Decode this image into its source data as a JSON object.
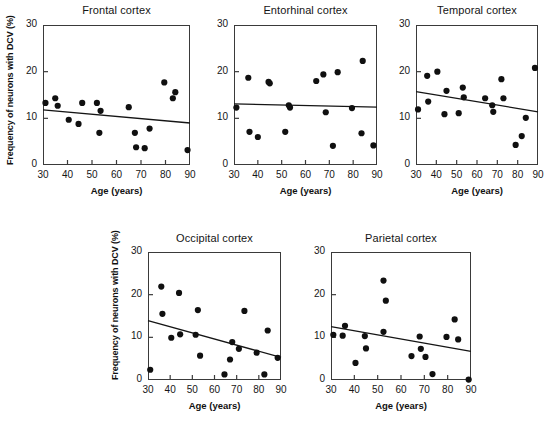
{
  "figure": {
    "xlabel": "Age (years)",
    "ylabel": "Frequency of neurons with DCV (%)",
    "xticks": [
      "30",
      "40",
      "50",
      "60",
      "70",
      "80",
      "90"
    ],
    "yticks": [
      "0",
      "10",
      "20",
      "30"
    ],
    "colors": {
      "point": "#101010",
      "line": "#151515",
      "axis": "#3a3a3a",
      "text": "#151515",
      "background": "#ffffff"
    }
  },
  "chart_data": [
    {
      "type": "scatter",
      "title": "Frontal cortex",
      "xlabel": "Age (years)",
      "ylabel": "Frequency of neurons with DCV (%)",
      "xlim": [
        30,
        90
      ],
      "ylim": [
        0,
        30
      ],
      "xticks": [
        30,
        40,
        50,
        60,
        70,
        80,
        90
      ],
      "yticks": [
        0,
        10,
        20,
        30
      ],
      "grid": false,
      "legend": "none",
      "points": [
        {
          "x": 31,
          "y": 13.3
        },
        {
          "x": 35,
          "y": 14.3
        },
        {
          "x": 36,
          "y": 12.7
        },
        {
          "x": 40.5,
          "y": 9.7
        },
        {
          "x": 44.5,
          "y": 8.8
        },
        {
          "x": 46,
          "y": 13.3
        },
        {
          "x": 52,
          "y": 13.3
        },
        {
          "x": 53,
          "y": 6.9
        },
        {
          "x": 53.5,
          "y": 11.6
        },
        {
          "x": 65,
          "y": 12.4
        },
        {
          "x": 67.5,
          "y": 6.9
        },
        {
          "x": 68,
          "y": 3.8
        },
        {
          "x": 71.5,
          "y": 3.6
        },
        {
          "x": 73.5,
          "y": 7.8
        },
        {
          "x": 79.5,
          "y": 17.7
        },
        {
          "x": 83,
          "y": 14.3
        },
        {
          "x": 84,
          "y": 15.6
        },
        {
          "x": 89,
          "y": 3.2
        }
      ],
      "trendline": {
        "x0": 30,
        "y0": 11.8,
        "x1": 90,
        "y1": 9.0
      }
    },
    {
      "type": "scatter",
      "title": "Entorhinal cortex",
      "xlabel": "Age (years)",
      "ylabel": "Frequency of neurons with DCV (%)",
      "xlim": [
        30,
        90
      ],
      "ylim": [
        0,
        30
      ],
      "xticks": [
        30,
        40,
        50,
        60,
        70,
        80,
        90
      ],
      "yticks": [
        0,
        10,
        20,
        30
      ],
      "grid": false,
      "legend": "none",
      "points": [
        {
          "x": 31,
          "y": 12.3
        },
        {
          "x": 36,
          "y": 18.7
        },
        {
          "x": 36.5,
          "y": 7.1
        },
        {
          "x": 40,
          "y": 6.0
        },
        {
          "x": 44.5,
          "y": 17.8
        },
        {
          "x": 45,
          "y": 17.5
        },
        {
          "x": 51.5,
          "y": 7.1
        },
        {
          "x": 53,
          "y": 12.8
        },
        {
          "x": 53.5,
          "y": 12.3
        },
        {
          "x": 64.5,
          "y": 18.0
        },
        {
          "x": 67.5,
          "y": 19.4
        },
        {
          "x": 68.5,
          "y": 11.3
        },
        {
          "x": 71.5,
          "y": 4.1
        },
        {
          "x": 73.5,
          "y": 19.9
        },
        {
          "x": 79.5,
          "y": 12.2
        },
        {
          "x": 83.5,
          "y": 6.8
        },
        {
          "x": 84,
          "y": 22.3
        },
        {
          "x": 88.5,
          "y": 4.2
        }
      ],
      "trendline": {
        "x0": 30,
        "y0": 13.1,
        "x1": 90,
        "y1": 12.4
      }
    },
    {
      "type": "scatter",
      "title": "Temporal cortex",
      "xlabel": "Age (years)",
      "ylabel": "Frequency of neurons with DCV (%)",
      "xlim": [
        30,
        90
      ],
      "ylim": [
        0,
        30
      ],
      "xticks": [
        30,
        40,
        50,
        60,
        70,
        80,
        90
      ],
      "yticks": [
        0,
        10,
        20,
        30
      ],
      "grid": false,
      "legend": "none",
      "points": [
        {
          "x": 31,
          "y": 11.9
        },
        {
          "x": 35.5,
          "y": 19.1
        },
        {
          "x": 36,
          "y": 13.6
        },
        {
          "x": 40.5,
          "y": 20.0
        },
        {
          "x": 44,
          "y": 10.9
        },
        {
          "x": 45,
          "y": 15.9
        },
        {
          "x": 51,
          "y": 11.1
        },
        {
          "x": 53,
          "y": 16.6
        },
        {
          "x": 53.5,
          "y": 14.5
        },
        {
          "x": 64,
          "y": 14.3
        },
        {
          "x": 67.5,
          "y": 12.8
        },
        {
          "x": 68,
          "y": 11.4
        },
        {
          "x": 72,
          "y": 18.4
        },
        {
          "x": 73,
          "y": 14.3
        },
        {
          "x": 79,
          "y": 4.3
        },
        {
          "x": 82,
          "y": 6.2
        },
        {
          "x": 84,
          "y": 10.1
        },
        {
          "x": 88.5,
          "y": 20.8
        }
      ],
      "trendline": {
        "x0": 30,
        "y0": 15.7,
        "x1": 90,
        "y1": 11.4
      }
    },
    {
      "type": "scatter",
      "title": "Occipital cortex",
      "xlabel": "Age (years)",
      "ylabel": "Frequency of neurons with DCV (%)",
      "xlim": [
        30,
        90
      ],
      "ylim": [
        0,
        30
      ],
      "xticks": [
        30,
        40,
        50,
        60,
        70,
        80,
        90
      ],
      "yticks": [
        0,
        10,
        20,
        30
      ],
      "grid": false,
      "legend": "none",
      "points": [
        {
          "x": 31,
          "y": 2.4
        },
        {
          "x": 36,
          "y": 21.9
        },
        {
          "x": 36.5,
          "y": 15.5
        },
        {
          "x": 40.5,
          "y": 9.9
        },
        {
          "x": 44,
          "y": 20.4
        },
        {
          "x": 44.5,
          "y": 10.7
        },
        {
          "x": 51.5,
          "y": 10.6
        },
        {
          "x": 52.5,
          "y": 16.4
        },
        {
          "x": 53.5,
          "y": 5.7
        },
        {
          "x": 64.5,
          "y": 1.3
        },
        {
          "x": 67,
          "y": 4.8
        },
        {
          "x": 68,
          "y": 8.9
        },
        {
          "x": 71,
          "y": 7.3
        },
        {
          "x": 73.5,
          "y": 16.2
        },
        {
          "x": 79,
          "y": 6.4
        },
        {
          "x": 82.5,
          "y": 1.3
        },
        {
          "x": 84,
          "y": 11.6
        },
        {
          "x": 88.5,
          "y": 5.2
        }
      ],
      "trendline": {
        "x0": 30,
        "y0": 13.9,
        "x1": 90,
        "y1": 5.3
      }
    },
    {
      "type": "scatter",
      "title": "Parietal cortex",
      "xlabel": "Age (years)",
      "ylabel": "Frequency of neurons with DCV (%)",
      "xlim": [
        30,
        90
      ],
      "ylim": [
        0,
        30
      ],
      "xticks": [
        30,
        40,
        50,
        60,
        70,
        80,
        90
      ],
      "yticks": [
        0,
        10,
        20,
        30
      ],
      "grid": false,
      "legend": "none",
      "points": [
        {
          "x": 31,
          "y": 10.6
        },
        {
          "x": 35,
          "y": 10.4
        },
        {
          "x": 36,
          "y": 12.7
        },
        {
          "x": 40.5,
          "y": 4.0
        },
        {
          "x": 44.5,
          "y": 10.3
        },
        {
          "x": 45,
          "y": 7.4
        },
        {
          "x": 52.5,
          "y": 23.3
        },
        {
          "x": 52.5,
          "y": 11.3
        },
        {
          "x": 53.5,
          "y": 18.6
        },
        {
          "x": 64.5,
          "y": 5.6
        },
        {
          "x": 68,
          "y": 10.2
        },
        {
          "x": 68.5,
          "y": 7.3
        },
        {
          "x": 70.5,
          "y": 5.4
        },
        {
          "x": 73.5,
          "y": 1.4
        },
        {
          "x": 79.5,
          "y": 10.1
        },
        {
          "x": 83,
          "y": 14.2
        },
        {
          "x": 84.5,
          "y": 9.5
        },
        {
          "x": 89,
          "y": 0.1
        }
      ],
      "trendline": {
        "x0": 30,
        "y0": 12.5,
        "x1": 90,
        "y1": 6.7
      }
    }
  ]
}
